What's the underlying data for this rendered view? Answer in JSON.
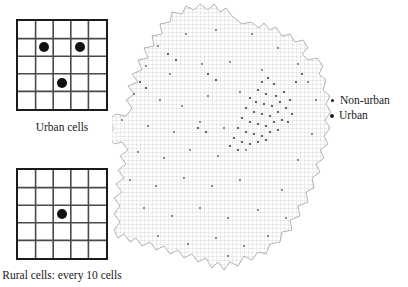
{
  "figure": {
    "title": "",
    "background_color": "#ffffff",
    "ink_color": "#1a1a1a"
  },
  "panels": [
    {
      "id": "urban-cells",
      "caption": "Urban cells",
      "grid": {
        "rows": 5,
        "cols": 5
      },
      "dots": [
        {
          "row": 2,
          "col": 2
        },
        {
          "row": 2,
          "col": 4
        },
        {
          "row": 4,
          "col": 3
        }
      ]
    },
    {
      "id": "rural-cells",
      "caption": "Rural cells: every 10 cells",
      "grid": {
        "rows": 5,
        "cols": 5
      },
      "dots": [
        {
          "row": 3,
          "col": 3
        }
      ]
    }
  ],
  "legend": {
    "items": [
      {
        "label": "Non-urban",
        "marker": "small-dot",
        "color": "#1d1d1d"
      },
      {
        "label": "Urban",
        "marker": "large-dot",
        "color": "#1d1d1d"
      }
    ]
  },
  "map": {
    "name": "region-outline-with-sampling-grid",
    "grid_color": "#b9b9b9",
    "outline_color": "#9a9a9a",
    "grid_spacing_px": 4,
    "point_color": "#555555",
    "clusters": [
      {
        "name": "central-east-dense-cluster",
        "approx_center": [
          268,
          110
        ]
      }
    ]
  }
}
